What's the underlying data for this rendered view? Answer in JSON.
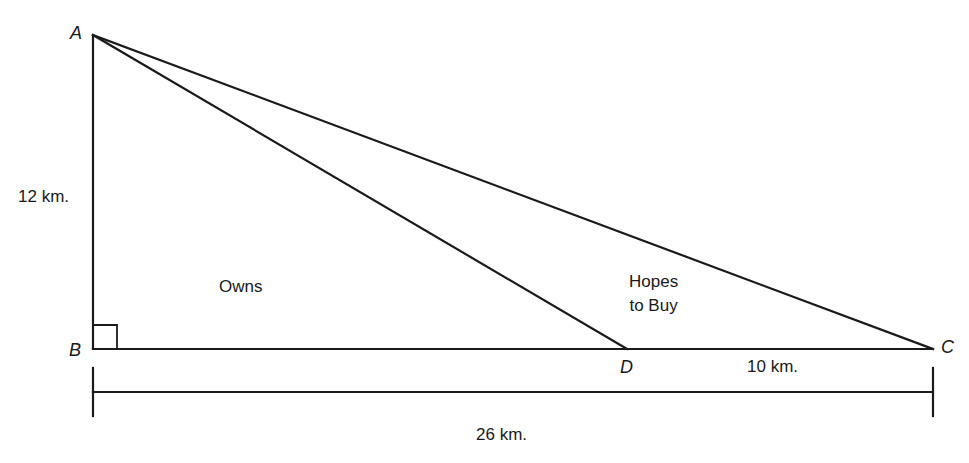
{
  "diagram": {
    "points": {
      "A": {
        "label": "A",
        "x": 93,
        "y": 35
      },
      "B": {
        "label": "B",
        "x": 93,
        "y": 349
      },
      "C": {
        "label": "C",
        "x": 933,
        "y": 349
      },
      "D": {
        "label": "D",
        "x": 627,
        "y": 349
      }
    },
    "segments": [
      "AB",
      "BC",
      "AC",
      "AD"
    ],
    "right_angle_at": "B",
    "measurements": {
      "AB": "12 km.",
      "DC": "10 km.",
      "BC": "26 km."
    },
    "regions": {
      "ABD": "Owns",
      "ADC_line1": "Hopes",
      "ADC_line2": "to Buy"
    },
    "colors": {
      "line": "#1a1a1a",
      "background": "#ffffff"
    }
  }
}
